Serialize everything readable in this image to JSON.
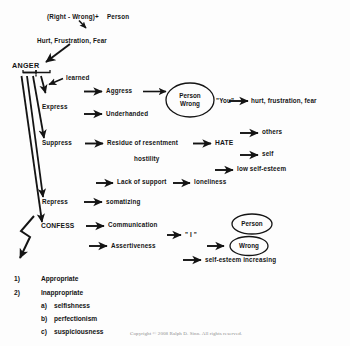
{
  "diagram": {
    "colors": {
      "background": "#fdfdfd",
      "ink": "#141414",
      "copyright_text": "#8e8e8e"
    },
    "top": {
      "premise": "(Right - Wrong)",
      "plus": "+",
      "person": "Person",
      "feelings": "Hurt, Frustration, Fear",
      "anger": "ANGER"
    },
    "branches": {
      "learned": "learned",
      "express": "Express",
      "suppress": "Suppress",
      "repress": "Repress",
      "confess": "CONFESS"
    },
    "express_row": {
      "aggress": "Aggress",
      "underhanded": "Underhanded",
      "ellipse_person": "Person",
      "ellipse_wrong": "Wrong",
      "you": "\"You\"",
      "outcome": "hurt, frustration, fear"
    },
    "suppress_row": {
      "residue": "Residue of resentment",
      "hostility": "hostility",
      "hate": "HATE",
      "hate_others": "others",
      "hate_self": "self",
      "low_self_esteem": "low self-esteem",
      "lack_of_support": "Lack of support",
      "loneliness": "loneliness"
    },
    "repress_row": {
      "somatizing": "somatizing"
    },
    "confess_row": {
      "communication": "Communication",
      "assertiveness": "Assertiveness",
      "i_statement": "\" I \"",
      "ellipse_person": "Person",
      "ellipse_wrong": "Wrong",
      "self_esteem": "self-esteem increasing"
    },
    "list": {
      "items": [
        {
          "marker": "1)",
          "label": "Appropriate"
        },
        {
          "marker": "2)",
          "label": "Inappropriate"
        }
      ],
      "sub_items": [
        {
          "marker": "a)",
          "label": "selfishness"
        },
        {
          "marker": "b)",
          "label": "perfectionism"
        },
        {
          "marker": "c)",
          "label": "suspiciousness"
        }
      ]
    },
    "footer": {
      "copyright": "Copyright © 2008 Ralph D. Sinn.  All rights reserved."
    }
  }
}
